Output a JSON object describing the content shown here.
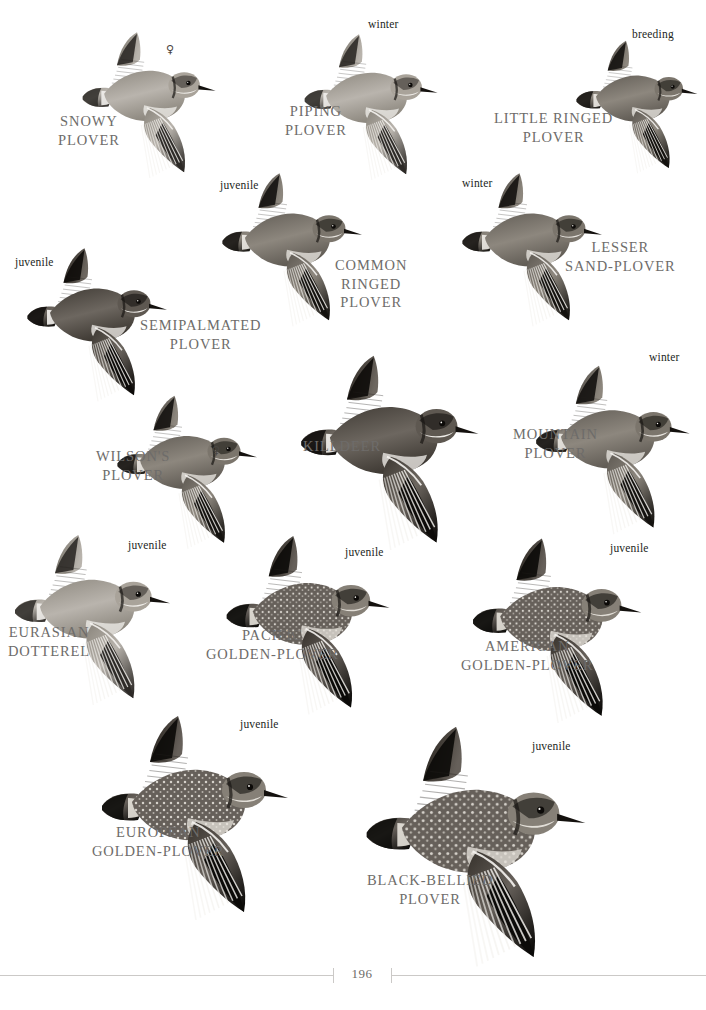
{
  "page": {
    "number": "196",
    "background_color": "#ffffff",
    "label_color": "#6e6c6a",
    "note_color": "#231f1c"
  },
  "plates": [
    {
      "id": "snowy-plover",
      "name": "SNOWY\nPLOVER",
      "note": "",
      "sex": "♀",
      "label_x": 58,
      "label_y": 112,
      "note_x": 0,
      "note_y": 0,
      "sex_x": 166,
      "sex_y": 43,
      "bird_x": 72,
      "bird_y": 28,
      "bird_w": 150,
      "bird_h": 150,
      "tone": "pale"
    },
    {
      "id": "piping-plover",
      "name": "PIPING\nPLOVER",
      "note": "winter",
      "sex": "",
      "label_x": 285,
      "label_y": 102,
      "note_x": 368,
      "note_y": 18,
      "sex_x": 0,
      "sex_y": 0,
      "bird_x": 295,
      "bird_y": 30,
      "bird_w": 148,
      "bird_h": 150,
      "tone": "pale"
    },
    {
      "id": "little-ringed-plover",
      "name": "LITTLE RINGED\nPLOVER",
      "note": "breeding",
      "sex": "",
      "label_x": 494,
      "label_y": 109,
      "note_x": 632,
      "note_y": 28,
      "sex_x": 0,
      "sex_y": 0,
      "bird_x": 570,
      "bird_y": 30,
      "bird_w": 130,
      "bird_h": 150,
      "tone": "mid"
    },
    {
      "id": "common-ringed-plover",
      "name": "COMMON\nRINGED\nPLOVER",
      "note": "juvenile",
      "sex": "",
      "label_x": 335,
      "label_y": 256,
      "note_x": 220,
      "note_y": 179,
      "sex_x": 0,
      "sex_y": 0,
      "bird_x": 215,
      "bird_y": 165,
      "bird_w": 150,
      "bird_h": 165,
      "tone": "mid"
    },
    {
      "id": "lesser-sand-plover",
      "name": "LESSER\nSAND-PLOVER",
      "note": "winter",
      "sex": "",
      "label_x": 565,
      "label_y": 238,
      "note_x": 462,
      "note_y": 177,
      "sex_x": 0,
      "sex_y": 0,
      "bird_x": 455,
      "bird_y": 165,
      "bird_w": 150,
      "bird_h": 165,
      "tone": "mid"
    },
    {
      "id": "semipalmated-plover",
      "name": "SEMIPALMATED\nPLOVER",
      "note": "juvenile",
      "sex": "",
      "label_x": 140,
      "label_y": 316,
      "note_x": 15,
      "note_y": 256,
      "sex_x": 0,
      "sex_y": 0,
      "bird_x": 20,
      "bird_y": 235,
      "bird_w": 150,
      "bird_h": 175,
      "tone": "dark"
    },
    {
      "id": "wilsons-plover",
      "name": "WILSON'S\nPLOVER",
      "note": "",
      "sex": "♀",
      "label_x": 96,
      "label_y": 447,
      "note_x": 0,
      "note_y": 0,
      "sex_x": 212,
      "sex_y": 444,
      "bird_x": 110,
      "bird_y": 385,
      "bird_w": 150,
      "bird_h": 170,
      "tone": "mid"
    },
    {
      "id": "killdeer",
      "name": "KILLDEER",
      "note": "",
      "sex": "",
      "label_x": 303,
      "label_y": 437,
      "note_x": 0,
      "note_y": 0,
      "sex_x": 0,
      "sex_y": 0,
      "bird_x": 282,
      "bird_y": 350,
      "bird_w": 210,
      "bird_h": 200,
      "tone": "dark"
    },
    {
      "id": "mountain-plover",
      "name": "MOUNTAIN\nPLOVER",
      "note": "winter",
      "sex": "",
      "label_x": 513,
      "label_y": 425,
      "note_x": 649,
      "note_y": 351,
      "sex_x": 0,
      "sex_y": 0,
      "bird_x": 528,
      "bird_y": 355,
      "bird_w": 165,
      "bird_h": 185,
      "tone": "mid"
    },
    {
      "id": "eurasian-dotterel",
      "name": "EURASIAN\nDOTTEREL",
      "note": "juvenile",
      "sex": "",
      "label_x": 8,
      "label_y": 623,
      "note_x": 128,
      "note_y": 539,
      "sex_x": 0,
      "sex_y": 0,
      "bird_x": 5,
      "bird_y": 530,
      "bird_w": 170,
      "bird_h": 175,
      "tone": "pale"
    },
    {
      "id": "pacific-golden-plover",
      "name": "PACIFIC\nGOLDEN-PLOVER",
      "note": "juvenile",
      "sex": "",
      "label_x": 206,
      "label_y": 626,
      "note_x": 345,
      "note_y": 546,
      "sex_x": 0,
      "sex_y": 0,
      "bird_x": 218,
      "bird_y": 530,
      "bird_w": 175,
      "bird_h": 185,
      "tone": "spot"
    },
    {
      "id": "american-golden-plover",
      "name": "AMERICAN\nGOLDEN-PLOVER",
      "note": "juvenile",
      "sex": "",
      "label_x": 461,
      "label_y": 637,
      "note_x": 610,
      "note_y": 542,
      "sex_x": 0,
      "sex_y": 0,
      "bird_x": 462,
      "bird_y": 533,
      "bird_w": 185,
      "bird_h": 190,
      "tone": "spot"
    },
    {
      "id": "european-golden-plover",
      "name": "EUROPEAN\nGOLDEN-PLOVER",
      "note": "juvenile",
      "sex": "",
      "label_x": 92,
      "label_y": 823,
      "note_x": 240,
      "note_y": 718,
      "sex_x": 0,
      "sex_y": 0,
      "bird_x": 92,
      "bird_y": 705,
      "bird_w": 200,
      "bird_h": 220,
      "tone": "spot"
    },
    {
      "id": "black-bellied-plover",
      "name": "BLACK-BELLIED\nPLOVER",
      "note": "juvenile",
      "sex": "",
      "label_x": 367,
      "label_y": 871,
      "note_x": 532,
      "note_y": 740,
      "sex_x": 0,
      "sex_y": 0,
      "bird_x": 355,
      "bird_y": 718,
      "bird_w": 235,
      "bird_h": 250,
      "tone": "spot"
    }
  ]
}
